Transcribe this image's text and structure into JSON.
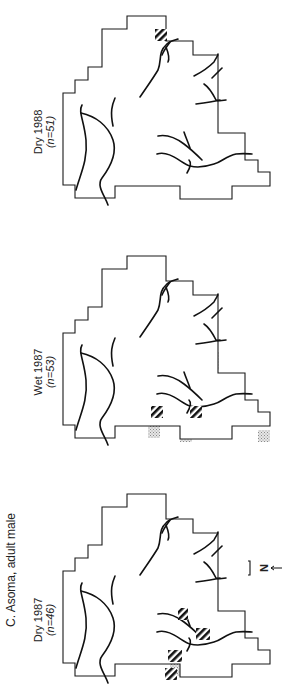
{
  "figure": {
    "panel_title": "C. Asoma, adult male",
    "north_label": "N",
    "colors": {
      "outline": "#1a1a1a",
      "stipple": "#b8b8b8",
      "stream": "#111111",
      "hatch": "#111111"
    },
    "maps": [
      {
        "season_label": "Dry 1988",
        "n_label": "(n=51)",
        "hatched_cells": 1
      },
      {
        "season_label": "Wet 1987",
        "n_label": "(n=53)",
        "hatched_cells": 2
      },
      {
        "season_label": "Dry 1987",
        "n_label": "(n=46)",
        "hatched_cells": 4
      }
    ],
    "legend": {
      "stipple_meaning": "",
      "hatch_meaning": ""
    }
  }
}
